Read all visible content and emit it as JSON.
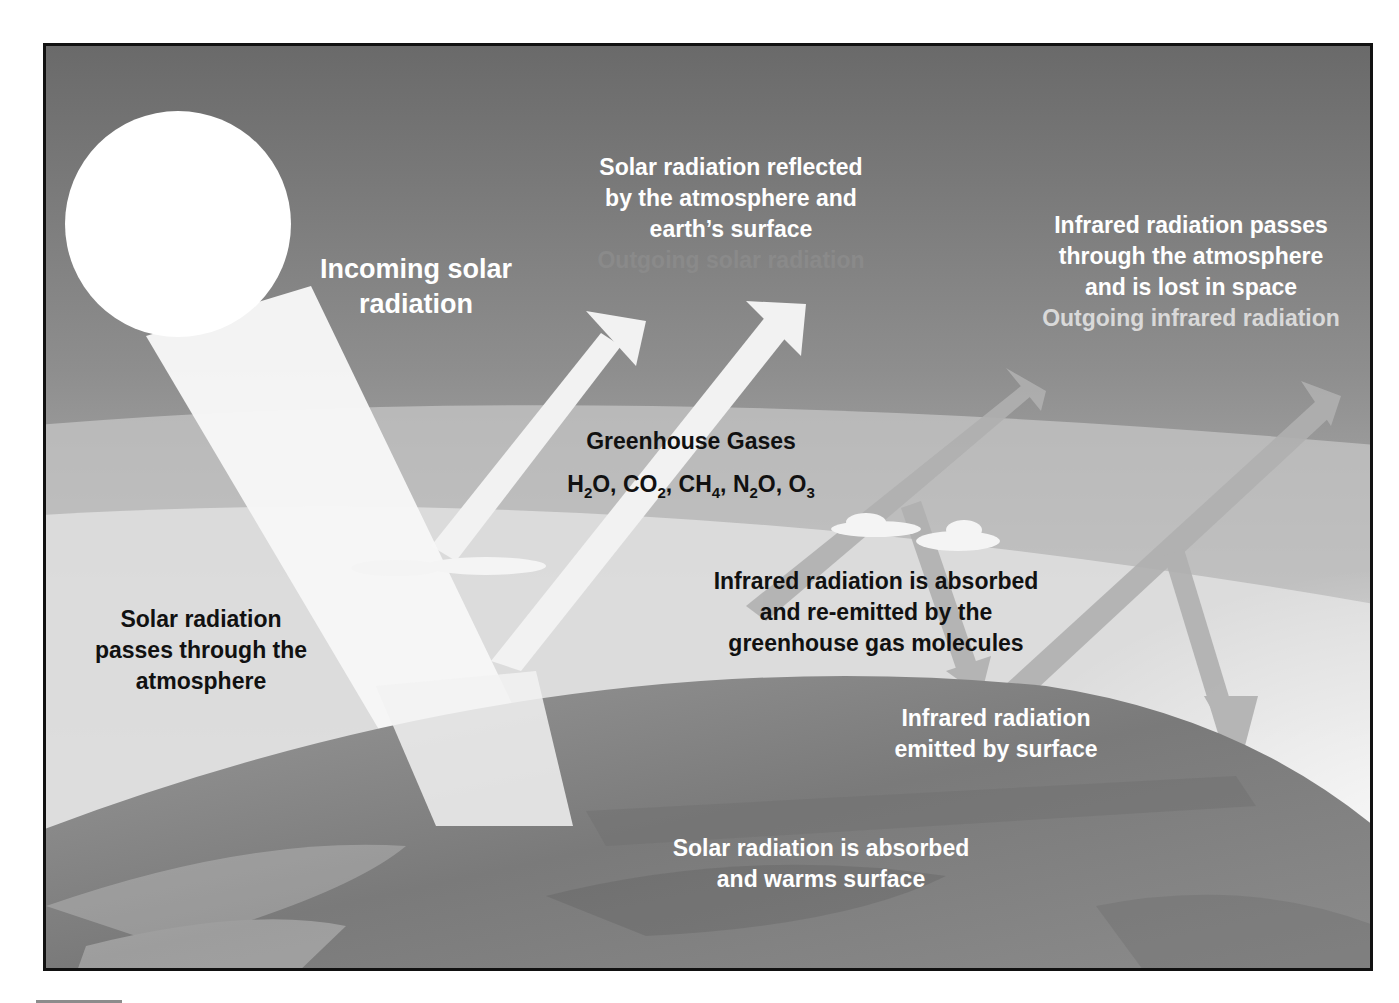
{
  "diagram": {
    "colors": {
      "sky_top": "#6e6e6e",
      "sky_mid": "#a8a8a8",
      "atmosphere_band": "#c9c9c9",
      "sun": "#ffffff",
      "earth": "#7f7f7f",
      "infrared_arrow": "#b3b3b3",
      "frame_border": "#111111"
    },
    "labels": {
      "incoming_solar": {
        "line1": "Incoming solar",
        "line2": "radiation"
      },
      "reflected": {
        "line1": "Solar radiation reflected",
        "line2": "by the atmosphere and",
        "line3": "earth’s surface",
        "sub": "Outgoing solar radiation"
      },
      "infrared_lost": {
        "line1": "Infrared radiation passes",
        "line2": "through the atmosphere",
        "line3": "and is lost in space",
        "sub": "Outgoing infrared radiation"
      },
      "greenhouse_gases": {
        "title": "Greenhouse Gases",
        "formulas": [
          {
            "base": "H",
            "sub": "2",
            "rest": "O"
          },
          {
            "base": "CO",
            "sub": "2",
            "rest": ""
          },
          {
            "base": "CH",
            "sub": "4",
            "rest": ""
          },
          {
            "base": "N",
            "sub": "2",
            "rest": "O"
          },
          {
            "base": "O",
            "sub": "3",
            "rest": ""
          }
        ]
      },
      "passes_through": {
        "line1": "Solar radiation",
        "line2": "passes through the",
        "line3": "atmosphere"
      },
      "absorbed_reemitted": {
        "line1": "Infrared radiation is absorbed",
        "line2": "and re-emitted by the",
        "line3": "greenhouse gas molecules"
      },
      "emitted_by_surface": {
        "line1": "Infrared radiation",
        "line2": "emitted by surface"
      },
      "absorbed_warms": {
        "line1": "Solar radiation is absorbed",
        "line2": "and warms surface"
      }
    }
  }
}
